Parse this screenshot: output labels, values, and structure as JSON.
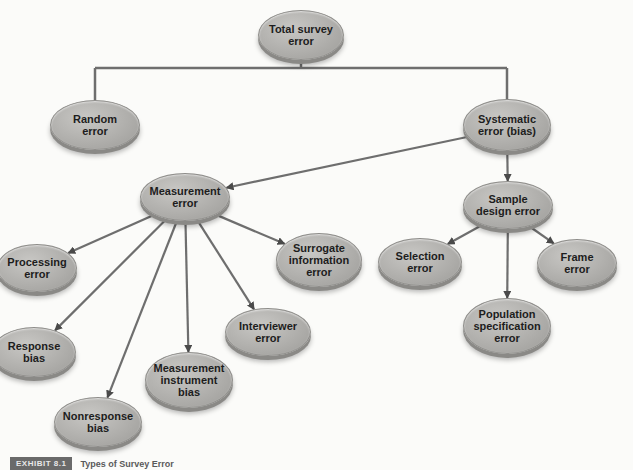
{
  "diagram": {
    "title": "Types of Survey Error",
    "colors": {
      "node_fill": "#b3b2af",
      "node_edge": "#8a8986",
      "connector": "#6e6e6e",
      "text": "#1d1d1d",
      "background": "#fbfbf9"
    },
    "nodes": [
      {
        "id": "total",
        "label": "Total survey\nerror",
        "cx": 301,
        "cy": 35,
        "w": 86,
        "h": 50
      },
      {
        "id": "random",
        "label": "Random\nerror",
        "cx": 95,
        "cy": 125,
        "w": 90,
        "h": 50
      },
      {
        "id": "systematic",
        "label": "Systematic\nerror (bias)",
        "cx": 507,
        "cy": 125,
        "w": 88,
        "h": 52
      },
      {
        "id": "measurement",
        "label": "Measurement\nerror",
        "cx": 185,
        "cy": 197,
        "w": 90,
        "h": 48
      },
      {
        "id": "sample_design",
        "label": "Sample\ndesign error",
        "cx": 508,
        "cy": 205,
        "w": 90,
        "h": 48
      },
      {
        "id": "processing",
        "label": "Processing\nerror",
        "cx": 37,
        "cy": 268,
        "w": 80,
        "h": 48
      },
      {
        "id": "surrogate",
        "label": "Surrogate\ninformation\nerror",
        "cx": 319,
        "cy": 260,
        "w": 86,
        "h": 54
      },
      {
        "id": "selection",
        "label": "Selection\nerror",
        "cx": 420,
        "cy": 262,
        "w": 84,
        "h": 48
      },
      {
        "id": "frame",
        "label": "Frame\nerror",
        "cx": 577,
        "cy": 263,
        "w": 80,
        "h": 48
      },
      {
        "id": "interviewer",
        "label": "Interviewer\nerror",
        "cx": 268,
        "cy": 332,
        "w": 86,
        "h": 48
      },
      {
        "id": "population",
        "label": "Population\nspecification\nerror",
        "cx": 507,
        "cy": 326,
        "w": 88,
        "h": 56
      },
      {
        "id": "response",
        "label": "Response\nbias",
        "cx": 34,
        "cy": 352,
        "w": 84,
        "h": 50
      },
      {
        "id": "instrument",
        "label": "Measurement\ninstrument\nbias",
        "cx": 189,
        "cy": 380,
        "w": 88,
        "h": 56
      },
      {
        "id": "nonresponse",
        "label": "Nonresponse\nbias",
        "cx": 98,
        "cy": 422,
        "w": 88,
        "h": 50
      }
    ],
    "tree_connectors": [
      {
        "from": "total",
        "to": "random"
      },
      {
        "from": "total",
        "to": "systematic"
      }
    ],
    "arrows": [
      {
        "from": "systematic",
        "to": "measurement"
      },
      {
        "from": "systematic",
        "to": "sample_design"
      },
      {
        "from": "measurement",
        "to": "processing"
      },
      {
        "from": "measurement",
        "to": "response"
      },
      {
        "from": "measurement",
        "to": "nonresponse"
      },
      {
        "from": "measurement",
        "to": "instrument"
      },
      {
        "from": "measurement",
        "to": "interviewer"
      },
      {
        "from": "measurement",
        "to": "surrogate"
      },
      {
        "from": "sample_design",
        "to": "selection"
      },
      {
        "from": "sample_design",
        "to": "population"
      },
      {
        "from": "sample_design",
        "to": "frame"
      }
    ]
  },
  "caption": {
    "tag": "EXHIBIT 8.1",
    "text": "Types of Survey Error"
  }
}
